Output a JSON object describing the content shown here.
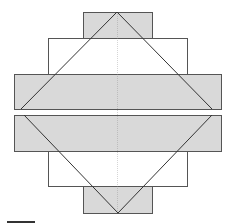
{
  "diagram": {
    "colors": {
      "fill": "#d9d9d9",
      "stroke": "#555555",
      "diagonal": "#333333",
      "centerline": "#888888",
      "background": "#ffffff"
    },
    "rects": [
      {
        "name": "top-block",
        "x": 83,
        "y": 12,
        "w": 69,
        "h": 26,
        "filled": true
      },
      {
        "name": "upper-middle-block",
        "x": 48,
        "y": 38,
        "w": 139,
        "h": 36,
        "filled": false
      },
      {
        "name": "upper-wide-block",
        "x": 14,
        "y": 74,
        "w": 207,
        "h": 35,
        "filled": true
      },
      {
        "name": "lower-wide-block",
        "x": 14,
        "y": 115,
        "w": 207,
        "h": 36,
        "filled": true
      },
      {
        "name": "lower-middle-block",
        "x": 48,
        "y": 151,
        "w": 139,
        "h": 35,
        "filled": false
      },
      {
        "name": "bottom-block",
        "x": 83,
        "y": 186,
        "w": 69,
        "h": 27,
        "filled": true
      }
    ],
    "upper_triangle": {
      "apex": [
        117,
        12
      ],
      "left": [
        21,
        109
      ],
      "right": [
        212,
        109
      ]
    },
    "lower_triangle": {
      "apex": [
        118,
        213
      ],
      "left": [
        24,
        115
      ],
      "right": [
        212,
        115
      ]
    },
    "centerline_x": 117,
    "scale_bar": {
      "x1": 7,
      "x2": 35,
      "y": 222
    }
  }
}
